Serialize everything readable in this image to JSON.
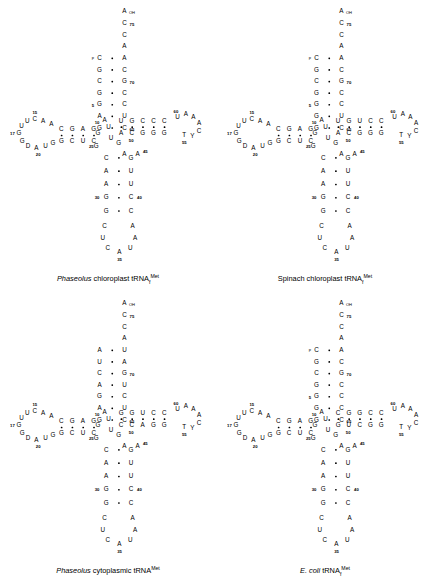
{
  "figure": {
    "type": "tRNA cloverleaf secondary structure diagrams",
    "panel_count": 4
  },
  "panels": [
    {
      "id": "phaseolus-chloroplast",
      "caption_italic": "Phaseolus",
      "caption_rest": "chloroplast tRNA",
      "caption_sub": "f",
      "caption_sup": "Met",
      "acceptor_stem": {
        "top_single": [
          "A",
          "C",
          "C",
          "A"
        ],
        "top_labels": [
          "OH",
          "75",
          "",
          ""
        ],
        "five_prime": [
          "C",
          "G",
          "C",
          "G",
          "G",
          "A",
          "G"
        ],
        "three_prime": [
          "A",
          "C",
          "G",
          "C",
          "C",
          "U",
          "C"
        ],
        "five_prime_mods": [
          "p",
          "",
          "",
          "",
          "5",
          "",
          ""
        ],
        "three_prime_labels": [
          "",
          "",
          "70",
          "",
          "",
          "",
          "65"
        ]
      },
      "d_arm": {
        "loop": [
          "U",
          "C",
          "A",
          "A",
          "A",
          "U",
          "G",
          "D",
          "A",
          "G"
        ],
        "stem_top": [
          "C",
          "G",
          "A",
          "G"
        ],
        "stem_bottom": [
          "G",
          "C",
          "U",
          "C"
        ],
        "labels": [
          "15",
          "17",
          "20",
          "25",
          "10"
        ],
        "mods": [
          "Gm"
        ]
      },
      "anticodon_arm": {
        "stem_left": [
          "G",
          "A",
          "A",
          "G",
          "G"
        ],
        "stem_right": [
          "C",
          "U",
          "U",
          "C",
          "C"
        ],
        "loop": [
          "C",
          "U",
          "C",
          "A",
          "U",
          "A",
          "A"
        ],
        "labels": [
          "30",
          "40",
          "35"
        ]
      },
      "t_arm": {
        "stem_top": [
          "U",
          "G",
          "C",
          "C",
          "C"
        ],
        "stem_bottom": [
          "A",
          "C",
          "G",
          "G",
          "G"
        ],
        "loop": [
          "U",
          "A",
          "A",
          "A",
          "C",
          "T",
          "Y"
        ],
        "labels": [
          "60",
          "55",
          "50",
          "45"
        ],
        "variable": [
          "U",
          "A",
          "U",
          "G",
          "A",
          "A"
        ],
        "mods": [
          "m7G",
          "m5C"
        ]
      }
    },
    {
      "id": "spinach-chloroplast",
      "caption_italic": "",
      "caption_rest": "Spinach chloroplast tRNA",
      "caption_sub": "f",
      "caption_sup": "Met",
      "acceptor_stem": {
        "top_single": [
          "A",
          "C",
          "C",
          "A"
        ],
        "top_labels": [
          "OH",
          "75",
          "",
          ""
        ],
        "five_prime": [
          "C",
          "G",
          "C",
          "G",
          "G",
          "G",
          "G"
        ],
        "three_prime": [
          "A",
          "C",
          "G",
          "C",
          "C",
          "U",
          "C"
        ],
        "five_prime_mods": [
          "p",
          "",
          "",
          "",
          "5",
          "",
          ""
        ],
        "three_prime_labels": [
          "",
          "",
          "70",
          "",
          "",
          "",
          "65"
        ]
      },
      "t_arm": {
        "stem_top": [
          "U",
          "G",
          "U",
          "C",
          "C"
        ],
        "stem_bottom": [
          "A",
          "C",
          "G",
          "G",
          "G"
        ],
        "loop": [
          "U",
          "A",
          "A",
          "A",
          "C",
          "T",
          "Y"
        ],
        "labels": [
          "60",
          "55",
          "50",
          "45"
        ]
      }
    },
    {
      "id": "phaseolus-cytoplasmic",
      "caption_italic": "Phaseolus",
      "caption_rest": "cytoplasmic tRNA",
      "caption_sub": "",
      "caption_sup": "Met",
      "acceptor_stem": {
        "top_single": [
          "A",
          "C",
          "C",
          "A"
        ],
        "top_labels": [
          "OH",
          "75",
          "",
          ""
        ],
        "five_prime": [
          "A",
          "U",
          "C",
          "A",
          "G",
          "A",
          "G"
        ],
        "three_prime": [
          "U",
          "A",
          "G",
          "U",
          "C",
          "U",
          "C"
        ],
        "three_prime_labels": [
          "",
          "",
          "70",
          "",
          "",
          "",
          "65"
        ]
      },
      "t_arm": {
        "stem_top": [
          "G",
          "G",
          "U",
          "C",
          "C"
        ],
        "stem_bottom": [
          "C",
          "C",
          "A",
          "G",
          "G"
        ],
        "loop": [
          "A",
          "A",
          "A",
          "C",
          "T",
          "Y"
        ],
        "labels": [
          "60",
          "55",
          "50"
        ],
        "mods": [
          "Gm",
          "m5C",
          "m1A"
        ]
      },
      "mods": [
        "m1G",
        "m2G",
        "t6A",
        "D"
      ]
    },
    {
      "id": "ecoli",
      "caption_italic": "E. coli",
      "caption_rest": "tRNA",
      "caption_sub": "f",
      "caption_sup": "Met",
      "acceptor_stem": {
        "top_single": [
          "A",
          "C",
          "C",
          "A"
        ],
        "top_labels": [
          "OH",
          "75",
          "",
          ""
        ],
        "five_prime": [
          "C",
          "G",
          "C",
          "G",
          "G",
          "G",
          "G"
        ],
        "three_prime": [
          "A",
          "C",
          "G",
          "C",
          "C",
          "C",
          "C"
        ],
        "five_prime_mods": [
          "p",
          "",
          "",
          "",
          "5",
          "",
          ""
        ],
        "three_prime_labels": [
          "",
          "",
          "70",
          "",
          "",
          "",
          "65"
        ]
      },
      "t_arm": {
        "stem_top": [
          "C",
          "G",
          "G",
          "C",
          "C"
        ],
        "stem_bottom": [
          "G",
          "U",
          "C",
          "G",
          "G"
        ],
        "loop": [
          "U",
          "A",
          "A",
          "A",
          "C",
          "T",
          "Y"
        ],
        "labels": [
          "60",
          "55",
          "50",
          "45"
        ]
      },
      "mods": [
        "s4U",
        "m7G",
        "Cm"
      ]
    }
  ]
}
